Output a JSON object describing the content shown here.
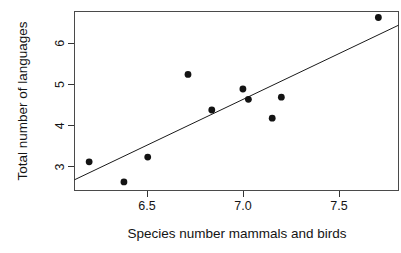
{
  "chart_data": {
    "type": "scatter",
    "title": "",
    "xlabel": "Species number mammals and birds",
    "ylabel": "Total number of languages",
    "xlim": [
      6.07,
      7.84
    ],
    "ylim": [
      2.52,
      6.7
    ],
    "xticks": [
      6.5,
      7.0,
      7.5
    ],
    "xtick_labels": [
      "6.5",
      "7.0",
      "7.5"
    ],
    "yticks": [
      3,
      4,
      5,
      6
    ],
    "ytick_labels": [
      "3",
      "4",
      "5",
      "6"
    ],
    "grid": false,
    "legend": null,
    "point_color": "#131313",
    "line_color": "#1a1a1a",
    "frame_color": "#4a4a4a",
    "points": [
      {
        "x": 6.15,
        "y": 3.19
      },
      {
        "x": 6.34,
        "y": 2.72
      },
      {
        "x": 6.47,
        "y": 3.3
      },
      {
        "x": 6.69,
        "y": 5.23
      },
      {
        "x": 6.82,
        "y": 4.4
      },
      {
        "x": 6.99,
        "y": 4.89
      },
      {
        "x": 7.02,
        "y": 4.65
      },
      {
        "x": 7.15,
        "y": 4.21
      },
      {
        "x": 7.2,
        "y": 4.7
      },
      {
        "x": 7.73,
        "y": 6.56
      }
    ],
    "fit_line": {
      "x1": 6.07,
      "y1": 2.77,
      "x2": 7.84,
      "y2": 6.38
    }
  },
  "axes": {
    "x_title": "Species number mammals and birds",
    "y_title": "Total number of languages",
    "x_tick_labels": [
      "6.5",
      "7.0",
      "7.5"
    ],
    "y_tick_labels": [
      "3",
      "4",
      "5",
      "6"
    ]
  }
}
